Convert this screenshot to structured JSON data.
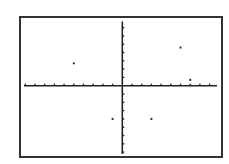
{
  "chart_data": {
    "type": "scatter",
    "title": "",
    "xlabel": "",
    "ylabel": "",
    "grid": false,
    "legend": null,
    "xlim": [
      -10,
      10
    ],
    "ylim": [
      -8,
      8
    ],
    "x_tick_step": 1,
    "y_tick_step": 1,
    "points": [
      {
        "x": -5,
        "y": 2.7
      },
      {
        "x": 6,
        "y": 4.6
      },
      {
        "x": 7,
        "y": 0.7
      },
      {
        "x": -1,
        "y": -4
      },
      {
        "x": 3,
        "y": -4
      }
    ],
    "colors": {
      "axis": "#222222",
      "frame": "#333333",
      "point": "#333333",
      "background": "#ffffff"
    }
  },
  "layout": {
    "frame": {
      "left": 20,
      "top": 17,
      "right": 222,
      "bottom": 157
    },
    "origin": {
      "x": 122.3,
      "y": 85.7
    },
    "x_unit_px": 9.7,
    "y_unit_px": 8.3,
    "x_axis_extent": [
      24,
      217
    ],
    "y_axis_extent": [
      21.5,
      154
    ]
  }
}
